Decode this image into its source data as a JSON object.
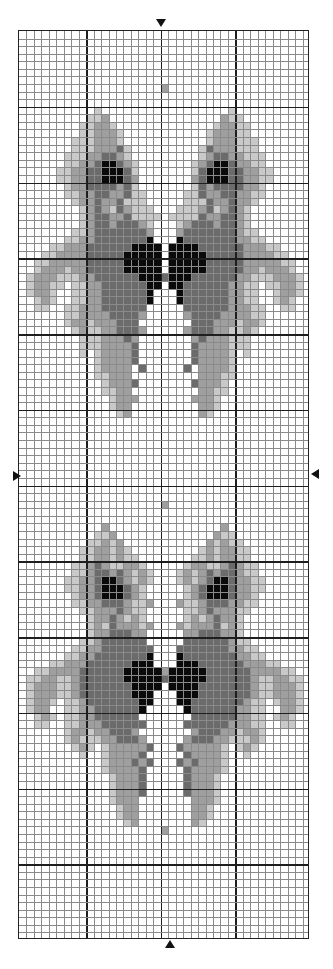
{
  "chart_data": {
    "type": "heatmap",
    "title": "",
    "columns": 39,
    "rows": 120,
    "major_every": 10,
    "major_col_offsets": [
      9,
      19,
      29
    ],
    "center_column": 19,
    "center_row": 60,
    "legend": [
      {
        "symbol": ".",
        "name": "empty",
        "color": "#ffffff"
      },
      {
        "symbol": "1",
        "name": "light-gray",
        "color": "#c9c9c9"
      },
      {
        "symbol": "2",
        "name": "mid-gray",
        "color": "#9f9f9f"
      },
      {
        "symbol": "3",
        "name": "dark-gray",
        "color": "#6b6b6b"
      },
      {
        "symbol": "4",
        "name": "black",
        "color": "#0a0a0a"
      }
    ],
    "mirror": true,
    "half_rows_start": 0,
    "half_rows": [
      "....................",
      "....................",
      "....................",
      "....................",
      "....................",
      "....................",
      "....................",
      "...................2",
      "....................",
      "....................",
      "..........1.........",
      ".........112........",
      "........11221.......",
      "........112221......",
      ".......1112221......",
      ".......11122231.....",
      "......111223321.....",
      "......1122344321....",
      ".....11223344431....",
      ".....11223344432....",
      "......1223333231....",
      "......11223322311...",
      ".......1223223111...",
      "........1232132111..",
      "........12332231111.",
      "........1233233321..",
      ".......11233333332..",
      "......112233333334..",
      "....112223333334444.",
      "...1122223333344444.",
      "..11222223333344444.",
      "..12221223333344444.",
      ".1222111223333334443",
      ".12211.112233333344.",
      ".1221..11223333334..",
      "..121..11223333334..",
      "..11..11222333333...",
      "......11222233332...",
      "......1221222333....",
      ".......1211223332...",
      "........11122232....",
      "........11122223....",
      "........1.122223....",
      "..........122223....",
      "..........12222.3...",
      "..........11222.....",
      "...........12223....",
      "...........1122.....",
      "............1222....",
      "............122.....",
      ".............12.....",
      "....................",
      "....................",
      "....................",
      "....................",
      "....................",
      "....................",
      "....................",
      "....................",
      "....................",
      "....................",
      "....................",
      "...................2",
      "....................",
      "....................",
      "...........2........",
      "..........112.......",
      ".........11212......",
      "........1122121.....",
      "........11221211....",
      ".......1123211221...",
      ".......11233232121..",
      "......112234432121..",
      "......11223444321...",
      ".......1223444321...",
      ".......11223332112..",
      "........112223211...",
      ".........12232121...",
      ".........121322212...",
      ".........12233322....",
      "........112333333....",
      ".......11223333333...",
      "......112233333334...",
      "....11222333333444...",
      "..112222333333444442.",
      ".1122112333333444443.",
      ".122211233333334444..",
      ".12221123333333444...",
      ".1221.112333333344...",
      ".122..11223333334....",
      "..121.1122333333.....",
      "..11..11222333333....",
      "......1221223332.....",
      "......12111223332....",
      ".......121.1222223...",
      "........1..122223....",
      "...........1222323...",
      "...........122223....",
      "............12223....",
      "............12223....",
      "............12223....",
      "............1222.....",
      ".............122.....",
      ".............122.....",
      "..............12.....",
      "...................2",
      "....................",
      "....................",
      "....................",
      "....................",
      "....................",
      "....................",
      "....................",
      "....................",
      "....................",
      "...................."
    ]
  },
  "markers": {
    "top": {
      "symbol": "triangle-down",
      "x": 161,
      "y": 21
    },
    "bottom": {
      "symbol": "triangle-up",
      "x": 170,
      "y": 941
    },
    "left": {
      "symbol": "triangle-right",
      "x": 14,
      "y": 473
    },
    "right": {
      "symbol": "triangle-left",
      "x": 312,
      "y": 471
    }
  }
}
